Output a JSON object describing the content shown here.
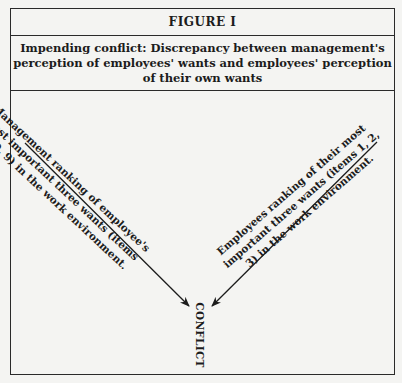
{
  "figure": {
    "label": "FIGURE I",
    "caption_lines": [
      "Impending conflict: Discrepancy between management's",
      "perception of employees' wants and employees' perception",
      "of their own wants"
    ]
  },
  "left_branch": {
    "lines": [
      "Management ranking of employee's",
      "most important three wants (items",
      "8, 10, 9) in the work environment."
    ]
  },
  "right_branch": {
    "lines": [
      "Employees ranking of their most",
      "important three wants (items 1, 2,",
      "3) in the work environment."
    ]
  },
  "convergence": {
    "label": "CONFLICT"
  },
  "colors": {
    "background": "#f4f4f2",
    "ink": "#1c1c1c"
  }
}
